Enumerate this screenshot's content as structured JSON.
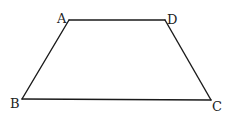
{
  "diagram": {
    "type": "trapezoid",
    "vertices": [
      {
        "id": "A",
        "label": "A"
      },
      {
        "id": "D",
        "label": "D"
      },
      {
        "id": "C",
        "label": "C"
      },
      {
        "id": "B",
        "label": "B"
      }
    ],
    "edges": [
      {
        "from": "A",
        "to": "D",
        "name": "AD"
      },
      {
        "from": "D",
        "to": "C",
        "name": "DC"
      },
      {
        "from": "C",
        "to": "B",
        "name": "CB"
      },
      {
        "from": "B",
        "to": "A",
        "name": "BA"
      }
    ],
    "labels": {
      "A": "A",
      "B": "B",
      "C": "C",
      "D": "D"
    }
  }
}
